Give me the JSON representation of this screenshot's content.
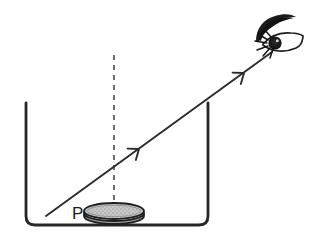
{
  "figure": {
    "background_color": "#ffffff",
    "ink_color": "#2a2a2a",
    "labels": {
      "coin_label": "P"
    },
    "elements": {
      "container": {
        "name": "container-vessel",
        "description": "open-top rectangular vessel with rounded bottom corners",
        "stroke_color": "#262626",
        "stroke_width": 2.6,
        "left_wall_x": 26,
        "right_wall_x": 208,
        "top_y": 103,
        "bottom_y": 225,
        "corner_radius": 9
      },
      "coin": {
        "name": "coin-P",
        "description": "shaded elliptical disk resting on the vessel floor",
        "center_x": 114,
        "center_y": 213,
        "radius_x": 30,
        "radius_y": 8,
        "thickness": 5,
        "fill_color": "#bfbfbf",
        "stroke_color": "#1e1e1e"
      },
      "normal_line": {
        "name": "normal-dashed-line",
        "description": "vertical dashed normal through the coin",
        "x": 114,
        "top_y": 55,
        "bottom_y": 216,
        "dash": "5 5",
        "stroke_color": "#555555",
        "stroke_width": 1.6
      },
      "light_ray": {
        "name": "light-ray",
        "description": "straight ray from coin P up-right to the eye",
        "start_x": 46,
        "start_y": 216,
        "end_x": 272,
        "end_y": 52,
        "stroke_color": "#2a2a2a",
        "stroke_width": 1.8,
        "arrowheads": [
          {
            "name": "ray-arrowhead-lower",
            "x": 139,
            "y": 149
          },
          {
            "name": "ray-arrowhead-upper",
            "x": 244,
            "y": 73
          }
        ]
      },
      "eye": {
        "name": "eye-observer",
        "description": "hand-drawn eye with heavy eyebrow, lashes and dark pupil",
        "center_x": 281,
        "center_y": 42,
        "fill_color": "#1a1a1a"
      }
    }
  }
}
